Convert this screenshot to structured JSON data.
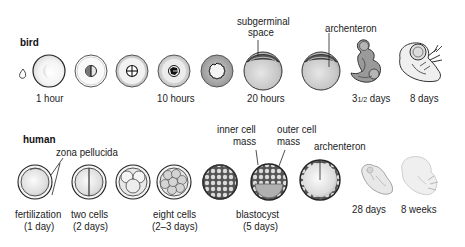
{
  "sections": {
    "bird": {
      "title": "bird",
      "stages": [
        {
          "id": "egg-cell",
          "label": ""
        },
        {
          "id": "1-hour",
          "label": "1 hour"
        },
        {
          "id": "first-cleavage",
          "label": ""
        },
        {
          "id": "second-cleavage",
          "label": ""
        },
        {
          "id": "10-hours",
          "label": "10 hours"
        },
        {
          "id": "blastoderm",
          "label": ""
        },
        {
          "id": "20-hours",
          "label": "20 hours"
        },
        {
          "id": "gastrula",
          "label": ""
        },
        {
          "id": "3-5-days",
          "label": "3½ days"
        },
        {
          "id": "8-days",
          "label": "8 days"
        }
      ],
      "labels": {
        "one_hour": "1 hour",
        "ten_hours": "10 hours",
        "twenty_hours": "20 hours",
        "three_half_days_main": "3",
        "three_half_days_frac": "1/2",
        "three_half_days_suffix": " days",
        "eight_days": "8 days"
      },
      "annotations": {
        "subgerminal_space_line1": "subgerminal",
        "subgerminal_space_line2": "space",
        "archenteron": "archenteron"
      }
    },
    "human": {
      "title": "human",
      "labels": {
        "fertilization": "fertilization",
        "fertilization_time": "(1 day)",
        "two_cells": "two cells",
        "two_cells_time": "(2 days)",
        "eight_cells": "eight cells",
        "eight_cells_time": "(2–3 days)",
        "blastocyst": "blastocyst",
        "blastocyst_time": "(5 days)",
        "twenty_eight_days": "28 days",
        "eight_weeks": "8 weeks"
      },
      "annotations": {
        "zona_pellucida": "zona pellucida",
        "inner_cell_mass_line1": "inner cell",
        "inner_cell_mass_line2": "mass",
        "outer_cell_mass_line1": "outer cell",
        "outer_cell_mass_line2": "mass",
        "archenteron": "archenteron"
      }
    }
  },
  "colors": {
    "outline": "#333333",
    "fill_light": "#eeeeee",
    "fill_mid": "#c8c8c8",
    "fill_dark": "#9a9a9a",
    "text": "#222222"
  }
}
